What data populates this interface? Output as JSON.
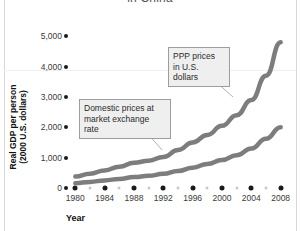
{
  "chart_data": {
    "type": "line",
    "title": "in China",
    "xlabel": "Year",
    "ylabel": "Real GDP per person\n(2000 U.S. dollars)",
    "x": [
      1980,
      1984,
      1988,
      1992,
      1996,
      2000,
      2004,
      2008
    ],
    "xlim": [
      1979,
      2009
    ],
    "ylim": [
      0,
      5600
    ],
    "xtick_labels": [
      "1980",
      "1984",
      "1988",
      "1992",
      "1996",
      "2000",
      "2004",
      "2008"
    ],
    "ytick_labels": [
      "0",
      "1,000",
      "2,000",
      "3,000",
      "4,000",
      "5,000"
    ],
    "ytick_values": [
      0,
      1000,
      2000,
      3000,
      4000,
      5000
    ],
    "grid": false,
    "legend": "annotations",
    "series": [
      {
        "name": "PPP prices in U.S. dollars",
        "color": "#7d7d7d",
        "x": [
          1980,
          1982,
          1984,
          1986,
          1988,
          1990,
          1992,
          1994,
          1996,
          1998,
          2000,
          2002,
          2004,
          2006,
          2008
        ],
        "values": [
          380,
          470,
          580,
          700,
          830,
          900,
          1020,
          1250,
          1500,
          1750,
          2050,
          2400,
          2900,
          3700,
          4800
        ]
      },
      {
        "name": "Domestic prices at market exchange rate",
        "color": "#7d7d7d",
        "x": [
          1980,
          1982,
          1984,
          1986,
          1988,
          1990,
          1992,
          1994,
          1996,
          1998,
          2000,
          2002,
          2004,
          2006,
          2008
        ],
        "values": [
          160,
          200,
          250,
          300,
          360,
          400,
          470,
          560,
          670,
          790,
          920,
          1080,
          1300,
          1620,
          2000
        ]
      }
    ],
    "annotations": [
      {
        "name": "ppp-prices",
        "text": "PPP prices\nin U.S. dollars",
        "box": {
          "left": 168,
          "top": 47,
          "width": 62,
          "height": 26
        },
        "leader": {
          "x1": 206,
          "y1": 73,
          "x2": 233,
          "y2": 97
        }
      },
      {
        "name": "domestic-prices",
        "text": "Domestic prices at\nmarket exchange rate",
        "box": {
          "left": 79,
          "top": 99,
          "width": 92,
          "height": 26
        },
        "leader": {
          "x1": 140,
          "y1": 125,
          "x2": 162,
          "y2": 150
        }
      }
    ]
  }
}
